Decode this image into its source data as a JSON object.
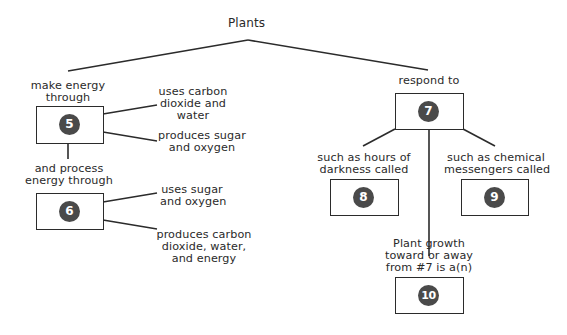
{
  "title": "Plants",
  "left_branch": {
    "label": "make energy\nthrough",
    "box5": {
      "number": "5"
    },
    "box5_note_top": "uses carbon\ndioxide and\nwater",
    "box5_note_bottom": "produces sugar\nand oxygen",
    "connector_label": "and process\nenergy through",
    "box6": {
      "number": "6"
    },
    "box6_note_top": "uses sugar\nand oxygen",
    "box6_note_bottom": "produces carbon\ndioxide, water,\nand energy"
  },
  "right_branch": {
    "label": "respond to",
    "box7": {
      "number": "7"
    },
    "left_label": "such as hours of\ndarkness called",
    "box8": {
      "number": "8"
    },
    "right_label": "such as chemical\nmessengers called",
    "box9": {
      "number": "9"
    },
    "center_label": "Plant growth\ntoward or away\nfrom #7 is a(n)",
    "box10": {
      "number": "10"
    }
  },
  "colors": {
    "line": "#2b2b2b",
    "number_circle": "#4a4a4a",
    "background": "#ffffff"
  }
}
